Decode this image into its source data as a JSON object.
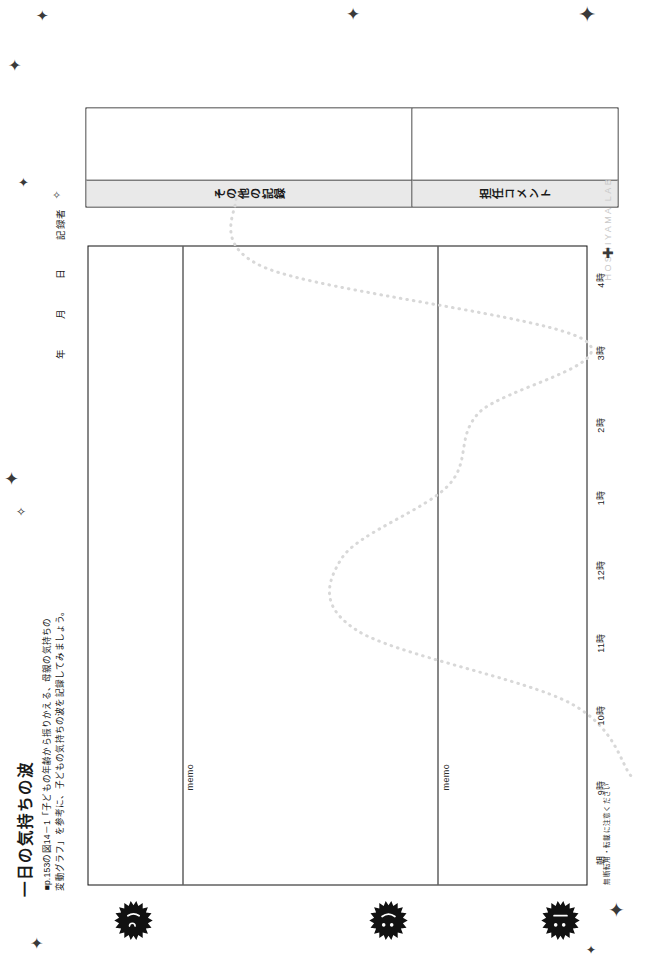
{
  "page": {
    "title": "一日の気持ちの波",
    "subtitle": "■p.153の図14－1「子どもの年齢から振りかえる、母親の気持ちの\n変動グラフ」を参考に、子どもの気持ちの波を記録してみましょう。",
    "date_fields": [
      "年",
      "月",
      "日",
      "記録者"
    ],
    "copyright_note": "無断転用・転載に注意ください",
    "watermark": "HOSHIYAMA LAB"
  },
  "record_boxes": [
    {
      "label": "その他の記録",
      "value": ""
    },
    {
      "label": "担任コメント",
      "value": ""
    }
  ],
  "memo_labels": [
    "memo",
    "memo"
  ],
  "faces": [
    {
      "name": "sun-face-wink-icon",
      "mood": "wink"
    },
    {
      "name": "sun-face-smile-icon",
      "mood": "smile"
    },
    {
      "name": "sun-face-neutral-icon",
      "mood": "neutral"
    }
  ],
  "chart_data": {
    "type": "line",
    "title": "一日の気持ちの波",
    "xlabel": "",
    "ylabel": "",
    "grid": false,
    "legend": "none",
    "categories": [
      "朝",
      "9時",
      "10時",
      "11時",
      "12時",
      "1時",
      "2時",
      "3時",
      "4時"
    ],
    "x": [
      0,
      1,
      2,
      3,
      4,
      5,
      6,
      7,
      8
    ],
    "ylim": [
      0,
      3
    ],
    "yticks": [
      "low",
      "mid",
      "high"
    ],
    "series": [
      {
        "name": "気持ちの波",
        "style": "dotted",
        "color": "#d8d8d8",
        "values": [
          0.15,
          0.55,
          1.95,
          2.05,
          1.35,
          1.15,
          0.45,
          2.55,
          2.75
        ]
      }
    ],
    "annotations": []
  },
  "colors": {
    "ink": "#111111",
    "rule": "#111111",
    "label_fill": "#e9e9e9",
    "curve": "#d8d8d8",
    "watermark": "#c9c9c9"
  }
}
